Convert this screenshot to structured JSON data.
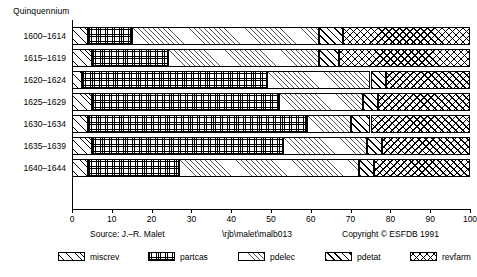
{
  "chart_data": {
    "type": "bar",
    "orientation": "horizontal",
    "stacked": true,
    "normalized_percent": true,
    "title": "",
    "ylabel": "Quinquennium",
    "xlabel": "",
    "xlim": [
      0,
      100
    ],
    "xticks": [
      0,
      10,
      20,
      30,
      40,
      50,
      60,
      70,
      80,
      90,
      100
    ],
    "grid": false,
    "legend_position": "bottom",
    "categories": [
      "1600–1614",
      "1615–1619",
      "1620–1624",
      "1625–1629",
      "1630–1634",
      "1635–1639",
      "1640–1644"
    ],
    "series": [
      {
        "name": "miscrev",
        "pattern": "diagonal-hatch-fine",
        "values": [
          4,
          5,
          2.5,
          5,
          4,
          5,
          4
        ]
      },
      {
        "name": "partcas",
        "pattern": "grid-crosshatch-fine",
        "values": [
          11,
          19,
          46.5,
          47,
          55,
          48,
          23
        ]
      },
      {
        "name": "pdelec",
        "pattern": "diagonal-hatch-light",
        "values": [
          47,
          38,
          26,
          21,
          11,
          21,
          45
        ]
      },
      {
        "name": "pdetat",
        "pattern": "diagonal-hatch-bold",
        "values": [
          6,
          5,
          4,
          4,
          5,
          4,
          4
        ]
      },
      {
        "name": "revfarm",
        "pattern": "diamond-crosshatch",
        "values": [
          32,
          33,
          21,
          23,
          25,
          22,
          24
        ]
      }
    ]
  },
  "axis": {
    "y_title": "Quinquennium",
    "x_tick_labels": [
      "0",
      "10",
      "20",
      "30",
      "40",
      "50",
      "60",
      "70",
      "80",
      "90",
      "100"
    ]
  },
  "footer": {
    "source": "Source: J.–R. Malet",
    "path": "\\rjb\\malet\\malb013",
    "copyright": "Copyright © ESFDB 1991"
  },
  "legend": {
    "items": [
      {
        "label": "miscrev"
      },
      {
        "label": "partcas"
      },
      {
        "label": "pdelec"
      },
      {
        "label": "pdetat"
      },
      {
        "label": "revfarm"
      }
    ]
  },
  "colors": {
    "ink": "#000000",
    "background": "#ffffff",
    "light_hatch": "#555555"
  }
}
